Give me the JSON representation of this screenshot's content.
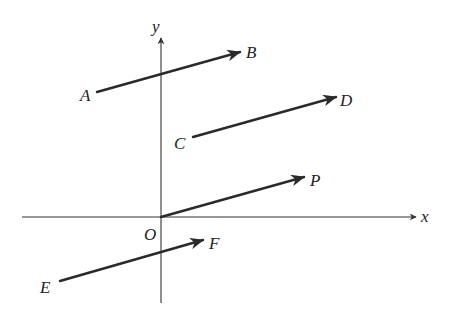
{
  "diagram": {
    "type": "vector-diagram",
    "colors": {
      "line": "#2a2a2a",
      "axis": "#333333",
      "background": "#ffffff"
    },
    "axes": {
      "origin_label": "O",
      "x_label": "x",
      "y_label": "y",
      "x_axis": {
        "x1": 22,
        "y1": 217,
        "x2": 416,
        "y2": 217
      },
      "y_axis": {
        "x1": 161,
        "y1": 303,
        "x2": 161,
        "y2": 38
      }
    },
    "vectors": [
      {
        "name": "AB",
        "start_label": "A",
        "end_label": "B",
        "x1": 97,
        "y1": 92,
        "x2": 240,
        "y2": 52
      },
      {
        "name": "CD",
        "start_label": "C",
        "end_label": "D",
        "x1": 193,
        "y1": 137,
        "x2": 336,
        "y2": 97
      },
      {
        "name": "OP",
        "start_label": "O",
        "end_label": "P",
        "x1": 161,
        "y1": 217,
        "x2": 304,
        "y2": 177
      },
      {
        "name": "EF",
        "start_label": "E",
        "end_label": "F",
        "x1": 60,
        "y1": 281,
        "x2": 203,
        "y2": 240
      }
    ],
    "labels": {
      "A": "A",
      "B": "B",
      "C": "C",
      "D": "D",
      "P": "P",
      "E": "E",
      "F": "F",
      "O": "O",
      "x": "x",
      "y": "y"
    }
  }
}
